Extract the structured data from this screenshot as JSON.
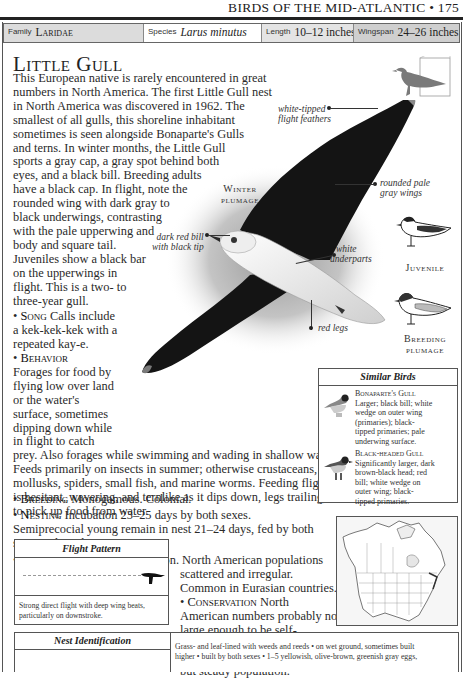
{
  "running_head": "BIRDS OF THE MID-ATLANTIC • 175",
  "info_bar": {
    "family_label": "Family",
    "family_value": "Laridae",
    "species_label": "Species",
    "species_value": "Larus minutus",
    "length_label": "Length",
    "length_value": "10–12 inches",
    "wingspan_label": "Wingspan",
    "wingspan_value": "24–26 inches"
  },
  "title": "Little Gull",
  "intro_lines": [
    "This European native is rarely encountered in great",
    "numbers in North America. The first Little Gull nest",
    "in North America was discovered in 1962. The",
    "smallest of all gulls, this shoreline inhabitant",
    "sometimes is seen alongside Bonaparte's Gulls",
    "and terns. In winter months, the Little Gull",
    "sports a gray cap, a gray spot behind both",
    "eyes, and a black bill. Breeding adults",
    "have a black cap. In flight, note the",
    "rounded wing with dark gray to",
    "black underwings, contrasting",
    "with the pale upperwing and",
    "body and square tail.",
    "Juveniles show a black bar",
    "on the upperwings in",
    "flight. This is a two- to",
    "three-year gull."
  ],
  "song": {
    "heading": "Song",
    "lines": [
      "Calls include",
      "a kek-kek-kek with a",
      "repeated kay-e."
    ]
  },
  "behavior": {
    "heading": "Behavior",
    "narrow_lines": [
      "Forages for food by",
      "flying low over land",
      "or the water's",
      "surface, sometimes",
      "dipping down while",
      "in flight to catch"
    ],
    "wide_lines": [
      "prey. Also forages while swimming and wading in shallow water.",
      "Feeds primarily on insects in summer; otherwise crustaceans,",
      "mollusks, spiders, small fish, and marine worms. Feeding flight",
      "is hesitant, wavering, and ternlike as it dips down, legs trailing,",
      "to pick up food from water."
    ]
  },
  "breeding": {
    "heading": "Breeding",
    "text": "Monogamous. Colonial."
  },
  "nesting": {
    "heading": "Nesting",
    "lines": [
      "Incubation 23–25 days by both sexes.",
      "Semiprecocial young remain in nest 21–24 days, fed by both",
      "sexes. 1 brood per year."
    ]
  },
  "population": {
    "heading": "Population",
    "lines": [
      "Rare to uncommon. North American populations",
      "scattered and irregular.",
      "Common in Eurasian countries."
    ]
  },
  "conservation": {
    "heading": "Conservation",
    "lines": [
      "North",
      "American numbers probably not",
      "large enough to be self-",
      "sustaining, but birds migrating",
      "from Europe maintain a small",
      "but steady population."
    ]
  },
  "illustration": {
    "plumage_label_1": "Winter",
    "plumage_label_2": "plumage",
    "annotations": {
      "white_tipped": [
        "white-tipped",
        "flight feathers"
      ],
      "rounded_wings": [
        "rounded pale",
        "gray wings"
      ],
      "bill": [
        "dark red bill",
        "with black tip"
      ],
      "underparts": [
        "white",
        "underparts"
      ],
      "legs": "red legs"
    },
    "juvenile_label": "Juvenile",
    "breeding_label_1": "Breeding",
    "breeding_label_2": "plumage"
  },
  "similar_birds": {
    "heading": "Similar Birds",
    "items": [
      {
        "name": "Bonaparte's Gull",
        "lines": [
          "Larger; black bill; white",
          "wedge on outer wing",
          "(primaries); black-",
          "tipped primaries; pale",
          "underwing surface."
        ]
      },
      {
        "name": "Black-headed Gull",
        "lines": [
          "Significantly larger, dark",
          "brown-black head; red",
          "bill; white wedge on",
          "outer wing; black-",
          "tipped primaries."
        ]
      }
    ]
  },
  "flight_pattern": {
    "heading": "Flight Pattern",
    "caption_lines": [
      "Strong direct flight with deep wing beats,",
      "particularly on downstroke."
    ]
  },
  "nest_identification": {
    "heading": "Nest Identification",
    "lines": [
      "Grass- and leaf-lined with weeds and reeds • on wet ground, sometimes built",
      "higher • built by both sexes • 1–5 yellowish, olive-brown, greenish gray eggs,"
    ]
  },
  "colors": {
    "rule": "#222222",
    "family_cell": "#dcdcdc",
    "wingspan_cell": "#cfcfcf",
    "silhouette": "#7a7a7a"
  }
}
